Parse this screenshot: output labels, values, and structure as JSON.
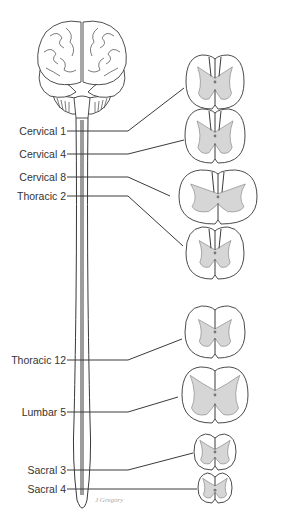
{
  "diagram": {
    "structures": {
      "brain": "brain-front-view",
      "cord": "spinal-cord"
    },
    "levels": [
      {
        "id": "c1",
        "label": "Cervical 1",
        "section_shape": "cervical-upper"
      },
      {
        "id": "c4",
        "label": "Cervical 4",
        "section_shape": "cervical-mid"
      },
      {
        "id": "c8",
        "label": "Cervical 8",
        "section_shape": "cervical-enlargement"
      },
      {
        "id": "t2",
        "label": "Thoracic 2",
        "section_shape": "thoracic-upper"
      },
      {
        "id": "t12",
        "label": "Thoracic 12",
        "section_shape": "thoracic-lower"
      },
      {
        "id": "l5",
        "label": "Lumbar 5",
        "section_shape": "lumbar"
      },
      {
        "id": "s3",
        "label": "Sacral 3",
        "section_shape": "sacral"
      },
      {
        "id": "s4",
        "label": "Sacral 4",
        "section_shape": "sacral-small"
      }
    ],
    "signature": "J Gregory",
    "colors": {
      "line": "#3a3a3a",
      "gray_matter": "#d6d6d6",
      "text": "#333333",
      "signature": "#a8a8a8"
    }
  }
}
